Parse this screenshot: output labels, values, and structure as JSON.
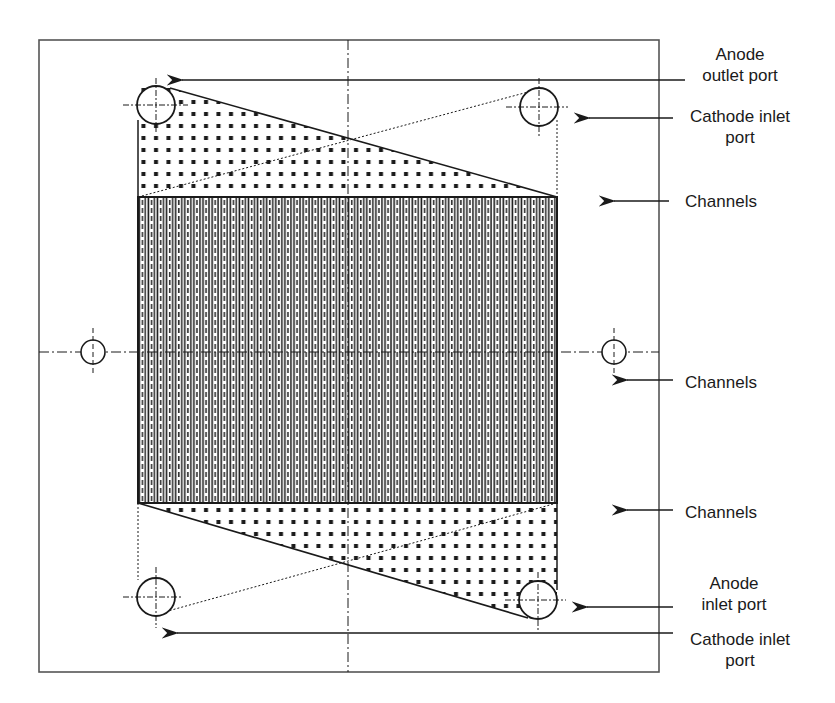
{
  "diagram": {
    "frame": {
      "x": 39,
      "y": 40,
      "w": 620,
      "h": 632
    },
    "channel_block": {
      "x": 138,
      "y": 197,
      "w": 419,
      "h": 306,
      "channel_count": 46
    },
    "centerlines": {
      "vertical_x": 348,
      "horizontal_y": 352
    },
    "colors": {
      "line": "#1a1a1a",
      "frame": "#555555",
      "background": "#ffffff"
    },
    "ports": [
      {
        "id": "anode-outlet",
        "cx": 156,
        "cy": 105,
        "r": 19
      },
      {
        "id": "cathode-inlet-top",
        "cx": 539,
        "cy": 107,
        "r": 19
      },
      {
        "id": "anode-inlet",
        "cx": 538,
        "cy": 601,
        "r": 19
      },
      {
        "id": "cathode-inlet-bottom",
        "cx": 156,
        "cy": 597,
        "r": 19
      },
      {
        "id": "alignment-left",
        "cx": 93,
        "cy": 352,
        "r": 12
      },
      {
        "id": "alignment-right",
        "cx": 614,
        "cy": 352,
        "r": 12
      }
    ],
    "labels": [
      {
        "id": "anode-outlet-port",
        "text": "Anode\noutlet port",
        "x": 700,
        "y": 44,
        "arrow": {
          "x1": 685,
          "y1": 80,
          "x2": 180,
          "y2": 80
        }
      },
      {
        "id": "cathode-inlet-port-top",
        "text": "Cathode inlet\nport",
        "x": 680,
        "y": 105,
        "arrow": {
          "x1": 673,
          "y1": 118,
          "x2": 587,
          "y2": 118
        }
      },
      {
        "id": "channels-1",
        "text": "Channels",
        "x": 680,
        "y": 190,
        "arrow": {
          "x1": 669,
          "y1": 201,
          "x2": 612,
          "y2": 201
        }
      },
      {
        "id": "channels-2",
        "text": "Channels",
        "x": 680,
        "y": 372,
        "arrow": {
          "x1": 673,
          "y1": 380,
          "x2": 625,
          "y2": 380
        }
      },
      {
        "id": "channels-3",
        "text": "Channels",
        "x": 680,
        "y": 501,
        "arrow": {
          "x1": 673,
          "y1": 510,
          "x2": 625,
          "y2": 510
        }
      },
      {
        "id": "anode-inlet-port",
        "text": "Anode\ninlet port",
        "x": 690,
        "y": 572,
        "arrow": {
          "x1": 673,
          "y1": 607,
          "x2": 585,
          "y2": 607
        }
      },
      {
        "id": "cathode-inlet-port-bottom",
        "text": "Cathode inlet\nport",
        "x": 680,
        "y": 628,
        "arrow": {
          "x1": 673,
          "y1": 633,
          "x2": 175,
          "y2": 633
        }
      }
    ]
  }
}
